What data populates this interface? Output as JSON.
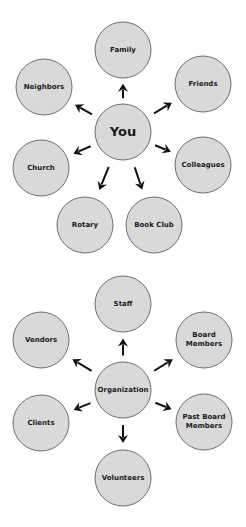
{
  "colors": {
    "node_fill": "#d9d9d9",
    "node_stroke": "#6e6e6e",
    "arrow": "#111111",
    "text": "#1a1a1a"
  },
  "diagrams": [
    {
      "center": {
        "label": "You",
        "x": 123,
        "y": 132,
        "r": 28,
        "font": 13
      },
      "nodes": [
        {
          "label": "Family",
          "x": 123,
          "y": 50,
          "r": 28
        },
        {
          "label": "Friends",
          "x": 203,
          "y": 84,
          "r": 28
        },
        {
          "label": "Colleagues",
          "x": 203,
          "y": 165,
          "r": 28
        },
        {
          "label": "Book Club",
          "x": 154,
          "y": 225,
          "r": 28
        },
        {
          "label": "Rotary",
          "x": 85,
          "y": 225,
          "r": 28
        },
        {
          "label": "Church",
          "x": 41,
          "y": 168,
          "r": 28
        },
        {
          "label": "Neighbors",
          "x": 44,
          "y": 87,
          "r": 28
        }
      ]
    },
    {
      "center": {
        "label": "Organization",
        "x": 123,
        "y": 390,
        "r": 28,
        "font": 7
      },
      "nodes": [
        {
          "label": "Staff",
          "x": 123,
          "y": 304,
          "r": 28
        },
        {
          "label": "Board Members",
          "x": 204,
          "y": 340,
          "r": 28
        },
        {
          "label": "Past Board Members",
          "x": 204,
          "y": 422,
          "r": 28
        },
        {
          "label": "Volunteers",
          "x": 123,
          "y": 478,
          "r": 28
        },
        {
          "label": "Clients",
          "x": 41,
          "y": 423,
          "r": 28
        },
        {
          "label": "Vendors",
          "x": 41,
          "y": 340,
          "r": 28
        }
      ]
    }
  ],
  "line_breaks": {
    "Board Members": [
      "Board",
      "Members"
    ],
    "Past Board Members": [
      "Past Board",
      "Members"
    ]
  }
}
